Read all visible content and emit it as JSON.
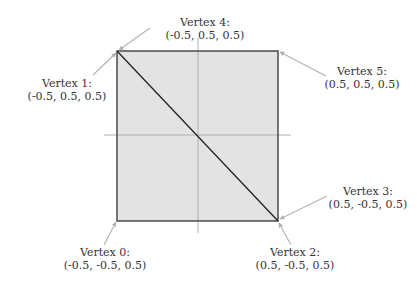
{
  "colors": {
    "fill": "#e3e3e3",
    "edge": "#333333",
    "axis": "#b0b0b0",
    "arrow": "#b5b5b5",
    "text": "#333333"
  },
  "vertices": [
    {
      "name": "Vertex 0:",
      "coords": "(-0.5, -0.5, 0.5)"
    },
    {
      "name": "Vertex 1:",
      "coords": "(-0.5, 0.5, 0.5)"
    },
    {
      "name": "Vertex 2:",
      "coords": "(0.5, -0.5, 0.5)"
    },
    {
      "name": "Vertex 3:",
      "coords": "(0.5, -0.5, 0.5)"
    },
    {
      "name": "Vertex 4:",
      "coords": "(-0.5, 0.5, 0.5)"
    },
    {
      "name": "Vertex 5:",
      "coords": "(0.5, 0.5, 0.5)"
    }
  ]
}
